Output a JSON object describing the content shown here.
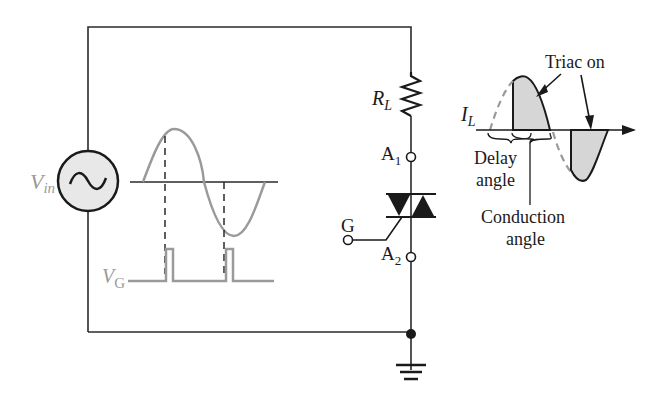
{
  "diagram": {
    "colors": {
      "wire": "#2a2a2a",
      "waveform": "#9a9a9a",
      "shaded": "#d6d6d6",
      "source_fill": "#e8e8e8",
      "label_gray": "#9a9a9a",
      "label_dark": "#1a1a1a"
    },
    "source": {
      "label_main": "V",
      "label_sub": "in",
      "icon": "ac-source-icon"
    },
    "gate_signal": {
      "label_main": "V",
      "label_sub": "G"
    },
    "load": {
      "label_main": "R",
      "label_sub": "L",
      "icon": "resistor-icon"
    },
    "triac": {
      "anode1_main": "A",
      "anode1_sub": "1",
      "anode2_main": "A",
      "anode2_sub": "2",
      "gate": "G",
      "icon": "triac-icon"
    },
    "ground": {
      "icon": "ground-icon"
    },
    "current_plot": {
      "current_label_main": "I",
      "current_label_sub": "L",
      "triac_on": "Triac on",
      "delay_angle_line1": "Delay",
      "delay_angle_line2": "angle",
      "conduction_angle_line1": "Conduction",
      "conduction_angle_line2": "angle"
    }
  }
}
